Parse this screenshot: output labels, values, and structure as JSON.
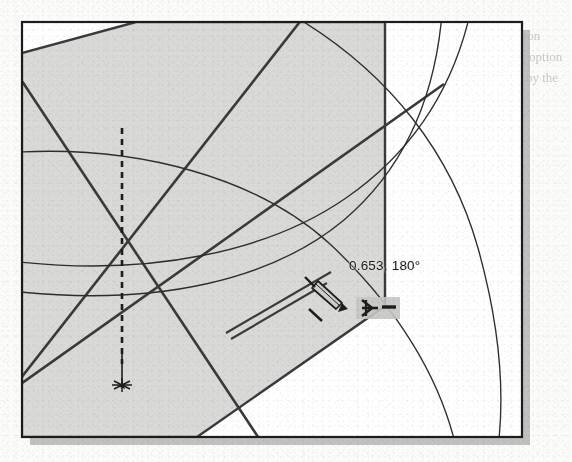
{
  "app": {
    "kind": "cad-drawing-screenshot",
    "title": "CAD sketch viewport"
  },
  "viewport": {
    "frame": {
      "x": 22,
      "y": 22,
      "width": 500,
      "height": 415,
      "border_color": "#1c1c1c",
      "fill_color": "#ffffff"
    },
    "shadow_color": "#b6b6b4",
    "page_background": "#fbfbfa",
    "shaded_fill": "#d9d9d7",
    "line_color": "#3a3a3a",
    "thin_line_color": "#2e2e2e"
  },
  "annotation": {
    "measurement_label": "0.653, 180°",
    "value": "0.653",
    "angle": "180°",
    "label_color": "#1b1b1b"
  },
  "cursor": {
    "pencil_icon": "pencil-cursor",
    "dimension_icon": "dimension-snap-cursor",
    "snap_marker": "snap-point-marker",
    "arrow_marker": "dimension-arrow"
  },
  "geometry": {
    "hexagon": {
      "name": "shaded-hexagon",
      "points": "22,53 135,22 385,22 385,180 385,305 196,437 22,437"
    },
    "dashed_dimension_line": {
      "name": "vertical-dashed-dimension",
      "x": 122,
      "y1": 127,
      "y2": 385,
      "dash": "6 5"
    },
    "cross_lines": [
      {
        "name": "diagonal-line-a",
        "x1": 22,
        "y1": 75,
        "x2": 258,
        "y2": 437
      },
      {
        "name": "diagonal-line-b",
        "x1": 22,
        "y1": 385,
        "x2": 298,
        "y2": 22
      },
      {
        "name": "diagonal-line-c",
        "x1": 22,
        "y1": 385,
        "x2": 420,
        "y2": 100
      }
    ],
    "arcs": [
      {
        "name": "arc-outer",
        "d": "M 22 152 Q 230 148 340 250 Q 420 330 452 437"
      },
      {
        "name": "arc-mid",
        "d": "M 22 262 Q 240 272 352 210 Q 438 150 470 22"
      },
      {
        "name": "arc-inner",
        "d": "M 22 290 Q 250 300 340 225 Q 412 160 440 22"
      },
      {
        "name": "arc-far",
        "d": "M 300 22 Q 450 120 487 260 Q 510 360 500 437"
      }
    ],
    "leader_lines": [
      {
        "name": "leader-long",
        "x1": 228,
        "y1": 330,
        "x2": 330,
        "y2": 272
      },
      {
        "name": "leader-short",
        "x1": 232,
        "y1": 334,
        "x2": 325,
        "y2": 281
      }
    ]
  },
  "ghost_text": [
    {
      "text": "of a Direction",
      "x": 470,
      "y": 40
    },
    {
      "text": "with Polar option",
      "x": 474,
      "y": 60
    },
    {
      "text": "are created by the",
      "x": 468,
      "y": 80
    }
  ]
}
